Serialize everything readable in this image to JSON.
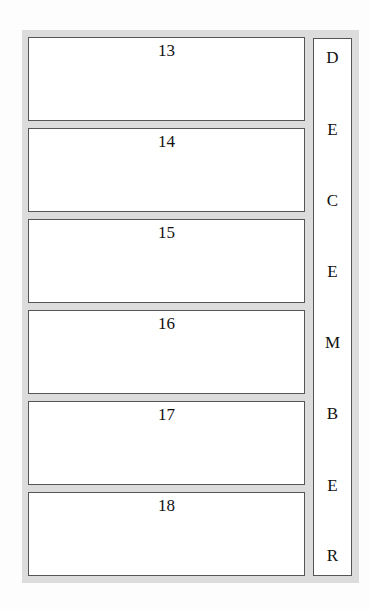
{
  "calendar": {
    "month_letters": [
      "D",
      "E",
      "C",
      "E",
      "M",
      "B",
      "E",
      "R"
    ],
    "days": [
      "13",
      "14",
      "15",
      "16",
      "17",
      "18"
    ]
  }
}
